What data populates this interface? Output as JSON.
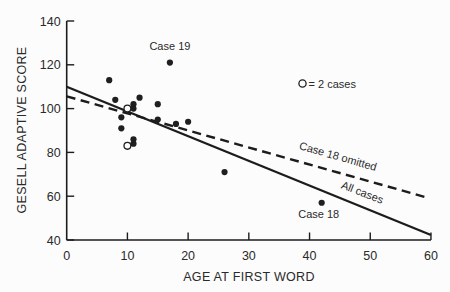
{
  "chart_data": {
    "type": "scatter",
    "xlabel": "AGE AT FIRST WORD",
    "ylabel": "GESELL ADAPTIVE SCORE",
    "xlim": [
      0,
      60
    ],
    "ylim": [
      40,
      140
    ],
    "x_ticks": [
      0,
      10,
      20,
      30,
      40,
      50,
      60
    ],
    "y_ticks": [
      140,
      120,
      100,
      80,
      60,
      40
    ],
    "grid": "off",
    "legend": {
      "symbol": "open-circle",
      "label": "= 2 cases"
    },
    "points_filled": [
      {
        "x": 7,
        "y": 113
      },
      {
        "x": 8,
        "y": 104
      },
      {
        "x": 12,
        "y": 105
      },
      {
        "x": 11,
        "y": 102
      },
      {
        "x": 15,
        "y": 102
      },
      {
        "x": 11,
        "y": 100
      },
      {
        "x": 9,
        "y": 96
      },
      {
        "x": 15,
        "y": 95
      },
      {
        "x": 20,
        "y": 94
      },
      {
        "x": 18,
        "y": 93
      },
      {
        "x": 9,
        "y": 91
      },
      {
        "x": 11,
        "y": 86
      },
      {
        "x": 11,
        "y": 84
      },
      {
        "x": 26,
        "y": 71
      },
      {
        "x": 42,
        "y": 57
      },
      {
        "x": 17,
        "y": 121
      }
    ],
    "points_two_cases": [
      {
        "x": 10,
        "y": 100
      },
      {
        "x": 10,
        "y": 83
      }
    ],
    "lines": [
      {
        "id": "all-cases",
        "label": "All cases",
        "style": "solid",
        "x1": 0,
        "y1": 110,
        "x2": 60,
        "y2": 42.3
      },
      {
        "id": "case-18-omitted",
        "label": "Case 18 omitted",
        "style": "dashed",
        "x1": 0,
        "y1": 105.6,
        "x2": 59.6,
        "y2": 59.2
      }
    ],
    "annotations": [
      {
        "text": "Case 19",
        "x": 17,
        "y": 121,
        "dx": 0,
        "dy": -13
      },
      {
        "text": "Case 18",
        "x": 42,
        "y": 57,
        "dx": -3,
        "dy": 15
      }
    ]
  }
}
